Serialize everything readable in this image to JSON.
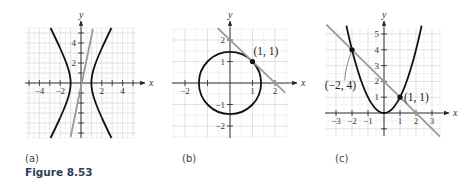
{
  "figure": {
    "caption": "Figure 8.53",
    "panels": [
      {
        "label": "(a)"
      },
      {
        "label": "(b)"
      },
      {
        "label": "(c)"
      }
    ]
  },
  "chart_data": [
    {
      "type": "line",
      "panel": "(a)",
      "title": "",
      "xlabel": "x",
      "ylabel": "y",
      "xlim": [
        -5.5,
        5.5
      ],
      "ylim": [
        -5.5,
        5.5
      ],
      "grid": true,
      "x_ticks": [
        -4,
        -2,
        2,
        4
      ],
      "y_ticks": [
        2,
        4
      ],
      "series": [
        {
          "name": "hyperbola",
          "equation": "x^2 - y^2/4 = 1",
          "color": "#111111",
          "vertices": [
            [
              -1,
              0
            ],
            [
              1,
              0
            ]
          ]
        },
        {
          "name": "line",
          "equation": "y = 5x",
          "color": "#999999"
        }
      ]
    },
    {
      "type": "line",
      "panel": "(b)",
      "title": "",
      "xlabel": "x",
      "ylabel": "y",
      "xlim": [
        -2.5,
        2.5
      ],
      "ylim": [
        -2.5,
        2.5
      ],
      "grid": true,
      "x_ticks": [
        -2,
        1,
        2
      ],
      "y_ticks": [
        -2,
        -1,
        1,
        2
      ],
      "series": [
        {
          "name": "circle",
          "equation": "x^2 + y^2 = 2",
          "color": "#111111"
        },
        {
          "name": "tangent line",
          "equation": "y = -x + 2",
          "color": "#999999"
        }
      ],
      "annotations": [
        {
          "point": [
            1,
            1
          ],
          "text": "(1, 1)"
        }
      ]
    },
    {
      "type": "line",
      "panel": "(c)",
      "title": "",
      "xlabel": "x",
      "ylabel": "y",
      "xlim": [
        -3.5,
        3.5
      ],
      "ylim": [
        -1.5,
        5.5
      ],
      "grid": true,
      "x_ticks": [
        -3,
        -2,
        -1,
        1,
        2,
        3
      ],
      "y_ticks": [
        1,
        2,
        3,
        4,
        5
      ],
      "series": [
        {
          "name": "parabola",
          "equation": "y = x^2",
          "color": "#111111"
        },
        {
          "name": "line",
          "equation": "y = -x + 2",
          "color": "#999999"
        }
      ],
      "annotations": [
        {
          "point": [
            -2,
            4
          ],
          "text": "(−2, 4)"
        },
        {
          "point": [
            1,
            1
          ],
          "text": "(1, 1)"
        }
      ]
    }
  ]
}
